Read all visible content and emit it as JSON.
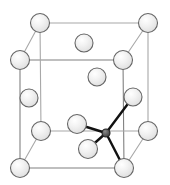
{
  "figure": {
    "name": "crystal-unit-cell-diagram",
    "width": 170,
    "height": 185,
    "background_color": "#ffffff"
  },
  "style": {
    "cube_edge_color": "#808080",
    "cube_edge_back_color": "#a8a8a8",
    "cube_edge_width": 1.1,
    "atom_stroke_color": "#666666",
    "atom_stroke_width": 1.1,
    "atom_fill_light": "#e8e8e8",
    "atom_fill_highlight": "#f7f7f7",
    "atom_fill_dark": "#555555",
    "atom_dark_stroke": "#222222",
    "bond_color": "#111111",
    "bond_width": 2.4,
    "atom_radius_large": 9.5,
    "atom_radius_small": 4.0
  },
  "cube": {
    "vertices": {
      "front_top_left": {
        "x": 20,
        "y": 60
      },
      "front_top_right": {
        "x": 123,
        "y": 60
      },
      "front_bottom_left": {
        "x": 20,
        "y": 168
      },
      "front_bottom_right": {
        "x": 124,
        "y": 168
      },
      "back_top_left": {
        "x": 40,
        "y": 23
      },
      "back_top_right": {
        "x": 148,
        "y": 23
      },
      "back_bottom_left": {
        "x": 41,
        "y": 131
      },
      "back_bottom_right": {
        "x": 148,
        "y": 131
      }
    },
    "edges": [
      {
        "name": "front-top-edge",
        "from": "front_top_left",
        "to": "front_top_right",
        "depth": "front"
      },
      {
        "name": "front-bottom-edge",
        "from": "front_bottom_left",
        "to": "front_bottom_right",
        "depth": "front"
      },
      {
        "name": "front-left-edge",
        "from": "front_top_left",
        "to": "front_bottom_left",
        "depth": "front"
      },
      {
        "name": "front-right-edge",
        "from": "front_top_right",
        "to": "front_bottom_right",
        "depth": "front"
      },
      {
        "name": "back-top-edge",
        "from": "back_top_left",
        "to": "back_top_right",
        "depth": "back"
      },
      {
        "name": "back-bottom-edge",
        "from": "back_bottom_left",
        "to": "back_bottom_right",
        "depth": "back"
      },
      {
        "name": "back-left-edge",
        "from": "back_top_left",
        "to": "back_bottom_left",
        "depth": "back"
      },
      {
        "name": "back-right-edge",
        "from": "back_top_right",
        "to": "back_bottom_right",
        "depth": "back"
      },
      {
        "name": "depth-edge-top-left",
        "from": "front_top_left",
        "to": "back_top_left",
        "depth": "back"
      },
      {
        "name": "depth-edge-top-right",
        "from": "front_top_right",
        "to": "back_top_right",
        "depth": "back"
      },
      {
        "name": "depth-edge-bottom-left",
        "from": "front_bottom_left",
        "to": "back_bottom_left",
        "depth": "back"
      },
      {
        "name": "depth-edge-bottom-right",
        "from": "front_bottom_right",
        "to": "back_bottom_right",
        "depth": "back"
      }
    ]
  },
  "atoms": [
    {
      "name": "atom-corner-back-top-left",
      "role": "corner",
      "x": 40,
      "y": 23,
      "r": 9.5,
      "kind": "light"
    },
    {
      "name": "atom-corner-back-top-right",
      "role": "corner",
      "x": 148,
      "y": 23,
      "r": 9.5,
      "kind": "light"
    },
    {
      "name": "atom-corner-front-top-left",
      "role": "corner",
      "x": 20,
      "y": 60,
      "r": 9.5,
      "kind": "light"
    },
    {
      "name": "atom-corner-front-top-right",
      "role": "corner",
      "x": 123,
      "y": 60,
      "r": 9.5,
      "kind": "light"
    },
    {
      "name": "atom-corner-back-bottom-left",
      "role": "corner",
      "x": 41,
      "y": 131,
      "r": 9.5,
      "kind": "light"
    },
    {
      "name": "atom-corner-back-bottom-right",
      "role": "corner",
      "x": 148,
      "y": 131,
      "r": 9.5,
      "kind": "light"
    },
    {
      "name": "atom-corner-front-bottom-left",
      "role": "corner",
      "x": 20,
      "y": 168,
      "r": 9.5,
      "kind": "light"
    },
    {
      "name": "atom-corner-front-bottom-right",
      "role": "corner",
      "x": 124,
      "y": 168,
      "r": 9.5,
      "kind": "light"
    },
    {
      "name": "atom-face-center-top",
      "role": "face-center",
      "x": 84,
      "y": 43,
      "r": 9.0,
      "kind": "light"
    },
    {
      "name": "atom-face-center-back",
      "role": "face-center",
      "x": 97,
      "y": 77,
      "r": 9.0,
      "kind": "light"
    },
    {
      "name": "atom-face-center-left",
      "role": "face-center",
      "x": 29,
      "y": 98,
      "r": 9.0,
      "kind": "light"
    },
    {
      "name": "atom-face-center-right",
      "role": "face-center",
      "x": 133,
      "y": 97,
      "r": 9.0,
      "kind": "light"
    },
    {
      "name": "atom-face-center-front",
      "role": "face-center",
      "x": 77,
      "y": 124,
      "r": 9.5,
      "kind": "light"
    },
    {
      "name": "atom-face-center-bottom",
      "role": "face-center",
      "x": 88,
      "y": 149,
      "r": 9.5,
      "kind": "light"
    },
    {
      "name": "atom-tetrahedral-center",
      "role": "interstitial",
      "x": 106,
      "y": 133,
      "r": 4.0,
      "kind": "dark"
    }
  ],
  "bonds": [
    {
      "name": "bond-center-to-right-face",
      "from": "atom-tetrahedral-center",
      "to": "atom-face-center-right"
    },
    {
      "name": "bond-center-to-front-face",
      "from": "atom-tetrahedral-center",
      "to": "atom-face-center-front"
    },
    {
      "name": "bond-center-to-bottom-face",
      "from": "atom-tetrahedral-center",
      "to": "atom-face-center-bottom"
    },
    {
      "name": "bond-center-to-front-bottom-right-corner",
      "from": "atom-tetrahedral-center",
      "to": "atom-corner-front-bottom-right"
    }
  ]
}
